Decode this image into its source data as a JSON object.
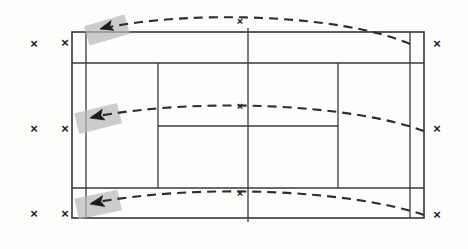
{
  "diagram": {
    "court": {
      "outer": {
        "x": 72,
        "y": 32,
        "width": 352,
        "height": 186
      },
      "singles_inset": 14,
      "service_line_top_y": 63,
      "service_line_bottom_y": 188,
      "net_x": 248,
      "center_service_line_left_x": 158,
      "center_service_line_right_x": 338,
      "line_color": "#35353a"
    },
    "trajectories": [
      {
        "name": "trajectory-top",
        "label": "serve-arc-1",
        "path": "M 410 44 C 340 14, 190 10, 104 28",
        "apex_x": 240,
        "apex_y": 15,
        "end_x": 104,
        "end_y": 28
      },
      {
        "name": "trajectory-middle",
        "label": "serve-arc-2",
        "path": "M 424 131 C 350 104, 200 97, 92 117",
        "apex_x": 240,
        "apex_y": 101,
        "end_x": 92,
        "end_y": 117
      },
      {
        "name": "trajectory-bottom",
        "label": "serve-arc-3",
        "path": "M 424 215 C 350 190, 200 183, 92 203",
        "apex_x": 240,
        "apex_y": 187,
        "end_x": 92,
        "end_y": 203
      }
    ],
    "arrows": [
      {
        "name": "impact-arrow-top",
        "x": 104,
        "y": 28,
        "angle": -16
      },
      {
        "name": "impact-arrow-middle",
        "x": 95,
        "y": 117,
        "angle": -14
      },
      {
        "name": "impact-arrow-bottom",
        "x": 95,
        "y": 203,
        "angle": -12
      }
    ],
    "highlights": [
      {
        "name": "impact-highlight-top",
        "x": 86,
        "y": 20,
        "width": 42,
        "height": 20,
        "angle": -16
      },
      {
        "name": "impact-highlight-middle",
        "x": 76,
        "y": 108,
        "width": 44,
        "height": 21,
        "angle": -14
      },
      {
        "name": "impact-highlight-bottom",
        "x": 76,
        "y": 194,
        "width": 44,
        "height": 21,
        "angle": -12
      }
    ],
    "markers": [
      {
        "name": "x-marker-outer-left-top",
        "glyph": "×",
        "x": 34,
        "y": 45
      },
      {
        "name": "x-marker-inner-left-top",
        "glyph": "×",
        "x": 65,
        "y": 44
      },
      {
        "name": "x-marker-outer-left-middle",
        "glyph": "×",
        "x": 34,
        "y": 130
      },
      {
        "name": "x-marker-inner-left-middle",
        "glyph": "×",
        "x": 65,
        "y": 130
      },
      {
        "name": "x-marker-outer-left-bottom",
        "glyph": "×",
        "x": 34,
        "y": 215
      },
      {
        "name": "x-marker-inner-left-bottom",
        "glyph": "×",
        "x": 65,
        "y": 215
      },
      {
        "name": "x-marker-center-top",
        "glyph": "×",
        "x": 240,
        "y": 22
      },
      {
        "name": "x-marker-center-middle",
        "glyph": "×",
        "x": 240,
        "y": 107
      },
      {
        "name": "x-marker-center-bottom",
        "glyph": "×",
        "x": 240,
        "y": 194
      },
      {
        "name": "x-marker-right-top",
        "glyph": "×",
        "x": 437,
        "y": 45
      },
      {
        "name": "x-marker-right-middle",
        "glyph": "×",
        "x": 437,
        "y": 130
      },
      {
        "name": "x-marker-right-bottom",
        "glyph": "×",
        "x": 437,
        "y": 216
      }
    ]
  }
}
